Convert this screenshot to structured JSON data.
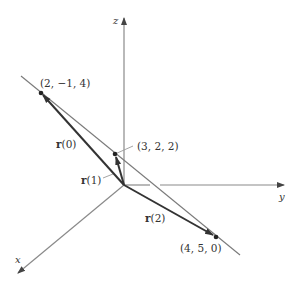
{
  "diagram": {
    "axes": {
      "x": {
        "label": "x"
      },
      "y": {
        "label": "y"
      },
      "z": {
        "label": "z"
      }
    },
    "points": [
      {
        "id": "p0",
        "label": "(2, −1,  4)"
      },
      {
        "id": "p1",
        "label": "(3, 2, 2)"
      },
      {
        "id": "p2",
        "label": "(4, 5, 0)"
      }
    ],
    "vectors": [
      {
        "id": "r0",
        "name": "r",
        "arg": "(0)"
      },
      {
        "id": "r1",
        "name": "r",
        "arg": "(1)"
      },
      {
        "id": "r2",
        "name": "r",
        "arg": "(2)"
      }
    ],
    "colors": {
      "axis": "#8a8a8a",
      "line": "#7a7a7a",
      "vector": "#333333",
      "text": "#333333"
    }
  }
}
